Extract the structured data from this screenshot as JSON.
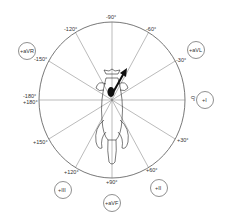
{
  "diagram": {
    "type": "hexaxial-reference-system",
    "center": [
      112,
      100
    ],
    "radius_x": 73,
    "radius_y": 78,
    "line_color": "#555555",
    "axis_labels": [
      {
        "id": "neg90",
        "text": "-90°",
        "angle": -90
      },
      {
        "id": "neg60",
        "text": "-60°",
        "angle": -60
      },
      {
        "id": "neg30",
        "text": "-30°",
        "angle": -30
      },
      {
        "id": "zero",
        "text": "0°",
        "angle": 0
      },
      {
        "id": "pos30",
        "text": "+30°",
        "angle": 30
      },
      {
        "id": "pos60",
        "text": "+60°",
        "angle": 60
      },
      {
        "id": "pos90",
        "text": "+90°",
        "angle": 90
      },
      {
        "id": "pos120",
        "text": "+120°",
        "angle": 120
      },
      {
        "id": "pos150",
        "text": "+150°",
        "angle": 150
      },
      {
        "id": "pos180",
        "text": "+180°",
        "angle": 180
      },
      {
        "id": "neg180",
        "text": "-180°",
        "angle": 180
      },
      {
        "id": "neg150",
        "text": "-150°",
        "angle": -150
      },
      {
        "id": "neg120",
        "text": "-120°",
        "angle": -120
      }
    ],
    "leads": [
      {
        "id": "avr",
        "text": "+aVR"
      },
      {
        "id": "avl",
        "text": "+aVL"
      },
      {
        "id": "lead1",
        "text": "+I"
      },
      {
        "id": "lead2",
        "text": "+II"
      },
      {
        "id": "avf",
        "text": "+aVF"
      },
      {
        "id": "lead3",
        "text": "+III"
      }
    ],
    "vector_arrow": {
      "direction_deg": -60,
      "color": "#111111"
    }
  }
}
